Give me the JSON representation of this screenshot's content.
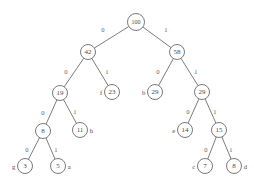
{
  "figure": {
    "colors": {
      "background": "#ffffff",
      "stroke": "#6b6b6b",
      "edge": "#6e6e6e",
      "text": "#4a4a4a",
      "label": "#5f5f5f"
    }
  },
  "chart_data": {
    "type": "diagram",
    "diagram_kind": "binary-tree",
    "edge_labels": [
      "0",
      "1"
    ],
    "nodes": [
      {
        "id": "n100",
        "value": "100",
        "symbol": "",
        "symbol_side": "",
        "x": 136,
        "y": 22,
        "r": 8.5,
        "kind": "internal",
        "depth": 0
      },
      {
        "id": "n42",
        "value": "42",
        "symbol": "",
        "symbol_side": "",
        "x": 88,
        "y": 52,
        "r": 7.5,
        "kind": "internal",
        "depth": 1
      },
      {
        "id": "n58",
        "value": "58",
        "symbol": "",
        "symbol_side": "",
        "x": 177,
        "y": 52,
        "r": 7.5,
        "kind": "internal",
        "depth": 1
      },
      {
        "id": "n19",
        "value": "19",
        "symbol": "",
        "symbol_side": "",
        "x": 60,
        "y": 93,
        "r": 7.5,
        "kind": "internal",
        "depth": 2
      },
      {
        "id": "n23",
        "value": "23",
        "symbol": "f",
        "symbol_side": "left",
        "x": 112,
        "y": 92,
        "r": 7.5,
        "kind": "leaf",
        "depth": 2
      },
      {
        "id": "n29b",
        "value": "29",
        "symbol": "b",
        "symbol_side": "left",
        "x": 155,
        "y": 92,
        "r": 7.5,
        "kind": "leaf",
        "depth": 2
      },
      {
        "id": "n29i",
        "value": "29",
        "symbol": "",
        "symbol_side": "",
        "x": 202,
        "y": 92,
        "r": 7.5,
        "kind": "internal",
        "depth": 2
      },
      {
        "id": "n8a",
        "value": "8",
        "symbol": "",
        "symbol_side": "",
        "x": 43,
        "y": 131,
        "r": 7.5,
        "kind": "internal",
        "depth": 3
      },
      {
        "id": "n11",
        "value": "11",
        "symbol": "h",
        "symbol_side": "right",
        "x": 80,
        "y": 130,
        "r": 7.5,
        "kind": "leaf",
        "depth": 3
      },
      {
        "id": "n14",
        "value": "14",
        "symbol": "e",
        "symbol_side": "left",
        "x": 185,
        "y": 130,
        "r": 7.5,
        "kind": "leaf",
        "depth": 3
      },
      {
        "id": "n15",
        "value": "15",
        "symbol": "",
        "symbol_side": "",
        "x": 219,
        "y": 130,
        "r": 7.5,
        "kind": "internal",
        "depth": 3
      },
      {
        "id": "n3",
        "value": "3",
        "symbol": "g",
        "symbol_side": "left",
        "x": 25,
        "y": 166,
        "r": 7.5,
        "kind": "leaf",
        "depth": 4
      },
      {
        "id": "n5",
        "value": "5",
        "symbol": "a",
        "symbol_side": "right",
        "x": 58,
        "y": 166,
        "r": 7.5,
        "kind": "leaf",
        "depth": 4
      },
      {
        "id": "n7",
        "value": "7",
        "symbol": "c",
        "symbol_side": "left",
        "x": 205,
        "y": 166,
        "r": 7.5,
        "kind": "leaf",
        "depth": 4
      },
      {
        "id": "n8d",
        "value": "8",
        "symbol": "d",
        "symbol_side": "right",
        "x": 234,
        "y": 166,
        "r": 7.5,
        "kind": "leaf",
        "depth": 4
      }
    ],
    "edges": [
      {
        "from": "n100",
        "to": "n42",
        "label": "0",
        "lx": 103,
        "ly": 29
      },
      {
        "from": "n100",
        "to": "n58",
        "label": "1",
        "lx": 166,
        "ly": 29
      },
      {
        "from": "n42",
        "to": "n19",
        "label": "0",
        "lx": 66,
        "ly": 71
      },
      {
        "from": "n42",
        "to": "n23",
        "label": "1",
        "lx": 107,
        "ly": 71
      },
      {
        "from": "n58",
        "to": "n29b",
        "label": "0",
        "lx": 158,
        "ly": 71
      },
      {
        "from": "n58",
        "to": "n29i",
        "label": "1",
        "lx": 196,
        "ly": 71
      },
      {
        "from": "n19",
        "to": "n8a",
        "label": "0",
        "lx": 43,
        "ly": 112
      },
      {
        "from": "n19",
        "to": "n11",
        "label": "1",
        "lx": 75,
        "ly": 111
      },
      {
        "from": "n29i",
        "to": "n14",
        "label": "0",
        "lx": 188,
        "ly": 111
      },
      {
        "from": "n29i",
        "to": "n15",
        "label": "1",
        "lx": 215,
        "ly": 111
      },
      {
        "from": "n8a",
        "to": "n3",
        "label": "0",
        "lx": 27,
        "ly": 149
      },
      {
        "from": "n8a",
        "to": "n5",
        "label": "1",
        "lx": 56,
        "ly": 149
      },
      {
        "from": "n15",
        "to": "n7",
        "label": "0",
        "lx": 206,
        "ly": 149
      },
      {
        "from": "n15",
        "to": "n8d",
        "label": "1",
        "lx": 231,
        "ly": 149
      }
    ]
  }
}
